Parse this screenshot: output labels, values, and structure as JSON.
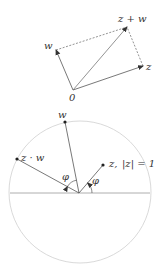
{
  "colors": {
    "vector": "#555555",
    "dashed": "#555555",
    "circle": "#cccccc",
    "axis": "#aaaaaa",
    "text": "#333333"
  },
  "top_diagram": {
    "title": "Vector addition parallelogram",
    "origin_label": "0",
    "w_label": "w",
    "z_label": "z",
    "sum_label": "z + w",
    "points": {
      "origin": [
        73,
        90
      ],
      "w": [
        56,
        50
      ],
      "z": [
        143,
        66
      ],
      "z_plus_w": [
        127,
        27
      ]
    }
  },
  "bottom_diagram": {
    "title": "Multiplication by unit complex number as rotation",
    "w_label": "w",
    "zw_label": "z · w",
    "z_label": "z,",
    "modulus_label": "|z| = 1",
    "angle_label_1": "φ",
    "angle_label_2": "φ",
    "circle": {
      "cx": 80,
      "cy": 192,
      "r": 71
    },
    "points": {
      "center": [
        79,
        193
      ],
      "w": [
        65,
        122
      ],
      "zw": [
        17,
        159
      ],
      "z": [
        103,
        165
      ]
    }
  }
}
